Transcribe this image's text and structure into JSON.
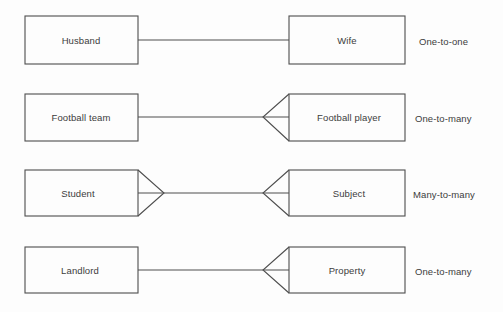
{
  "diagram": {
    "notation": "crow's foot",
    "colors": {
      "line": "#4e4e4e",
      "text": "#3c3c3c",
      "background": "#fdfdfd"
    },
    "relationships": [
      {
        "left_entity": "Husband",
        "right_entity": "Wife",
        "cardinality_label": "One-to-one",
        "left_end": "one",
        "right_end": "one"
      },
      {
        "left_entity": "Football team",
        "right_entity": "Football player",
        "cardinality_label": "One-to-many",
        "left_end": "one",
        "right_end": "many"
      },
      {
        "left_entity": "Student",
        "right_entity": "Subject",
        "cardinality_label": "Many-to-many",
        "left_end": "many",
        "right_end": "many"
      },
      {
        "left_entity": "Landlord",
        "right_entity": "Property",
        "cardinality_label": "One-to-many",
        "left_end": "one",
        "right_end": "many"
      }
    ]
  }
}
